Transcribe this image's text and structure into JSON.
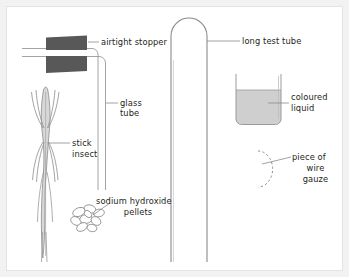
{
  "figure": {
    "type": "science-apparatus-diagram",
    "background_color": "#ffffff",
    "frame_color": "#e3e3e3",
    "outer_color": "#f2f2f2",
    "line_color": "#6e6e6e",
    "text_color": "#231f20",
    "stopper_color": "#585858",
    "liquid_color": "#cfcfcf"
  },
  "labels": {
    "airtight_stopper": "airtight stopper",
    "long_test_tube": "long test tube",
    "glass_tube_line1": "glass",
    "glass_tube_line2": "tube",
    "coloured_liquid_line1": "coloured",
    "coloured_liquid_line2": "liquid",
    "stick_insect_line1": "stick",
    "stick_insect_line2": "insect",
    "sodium_hydroxide_line1": "sodium hydroxide",
    "sodium_hydroxide_line2": "pellets",
    "wire_gauze_line1": "piece of",
    "wire_gauze_line2": "wire",
    "wire_gauze_line3": "gauze"
  },
  "components": {
    "airtight_stopper": "dark-grey-trapezoid-pair",
    "long_test_tube": "tall-rounded-top-tube",
    "glass_tube": "bent-double-line-tube",
    "beaker": "open-beaker-with-liquid",
    "coloured_liquid": "grey-filled-liquid",
    "stick_insect": "elongated-insect-outline",
    "sodium_hydroxide_pellets": "pellet-cluster",
    "wire_gauze": "dashed-arc"
  }
}
